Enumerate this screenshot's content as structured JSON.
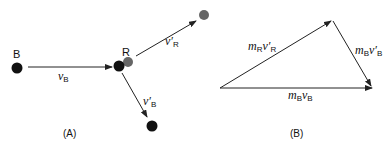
{
  "panel_a": {
    "caption": "(A)",
    "ball_b_label": "B",
    "ball_r_label": "R",
    "v_b": {
      "sym": "v",
      "sub": "B"
    },
    "v_r_prime": {
      "sym": "v′",
      "sub": "R"
    },
    "v_b_prime": {
      "sym": "v′",
      "sub": "B"
    }
  },
  "panel_b": {
    "caption": "(B)",
    "m_r_v_r_prime": {
      "m": "m",
      "msub": "R",
      "v": "v′",
      "vsub": "R"
    },
    "m_b_v_b_prime": {
      "m": "m",
      "msub": "B",
      "v": "v′",
      "vsub": "B"
    },
    "m_b_v_b": {
      "m": "m",
      "msub": "B",
      "v": "v",
      "vsub": "B"
    }
  },
  "colors": {
    "ball_dark": "#111111",
    "ball_grey": "#666666",
    "line": "#222222"
  }
}
